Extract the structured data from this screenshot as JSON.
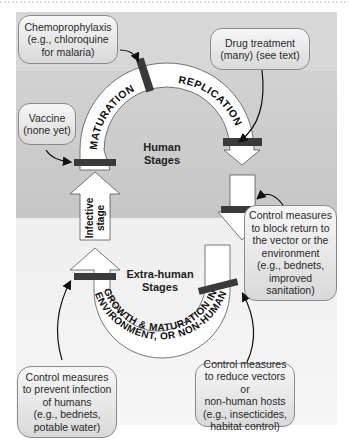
{
  "diagram": {
    "arc_labels": {
      "maturation": "MATURATION",
      "replication": "REPLICATION",
      "growth_line1": "GROWTH & MATURATION IN VECTOR,",
      "growth_line2": "ENVIRONMENT, OR NON-HUMAN HOST"
    },
    "stage_labels": {
      "human": "Human\nStages",
      "extra_human": "Extra-human\nStages",
      "infective": "Infective\nstage"
    },
    "callouts": {
      "chemoprophylaxis": "Chemoprophylaxis\n(e.g., chloroquine\nfor malaria)",
      "drug_treatment": "Drug treatment\n(many) (see text)",
      "vaccine": "Vaccine\n(none yet)",
      "block_return": "Control measures\nto block return to\nthe vector or the\nenvironment\n(e.g., bednets,\nimproved\nsanitation)",
      "prevent_infection": "Control measures\nto prevent infection\nof humans\n(e.g., bednets,\npotable water)",
      "reduce_vectors": "Control measures\nto reduce vectors or\nnon-human hosts\n(e.g., insecticides,\nhabitat control)"
    },
    "colors": {
      "upper_background": "#c9c9c9",
      "lower_background": "#ececec",
      "arrow_fill": "#ffffff",
      "block_bar": "#3a3a3a"
    }
  }
}
